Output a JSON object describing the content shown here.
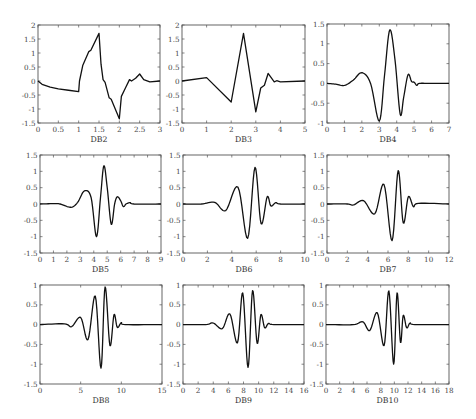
{
  "figure": {
    "panel_labels": [
      "DB2",
      "DB3",
      "DB4",
      "DB5",
      "DB6",
      "DB7",
      "DB8",
      "DB9",
      "DB10"
    ]
  },
  "chart_data": [
    {
      "type": "line",
      "title": "",
      "xlabel": "DB2",
      "ylabel": "",
      "xlim": [
        0,
        3
      ],
      "ylim": [
        -1.5,
        2
      ],
      "xticks": [
        0,
        0.5,
        1,
        1.5,
        2,
        2.5,
        3
      ],
      "xtick_labels": [
        "0",
        "0.5",
        "1",
        "1.5",
        "2",
        "2.5",
        "3"
      ],
      "yticks": [
        -1.5,
        -1,
        -0.5,
        0,
        0.5,
        1,
        1.5,
        2
      ],
      "ytick_labels": [
        "-1.5",
        "-1",
        "-0.5",
        "0",
        "0.5",
        "1",
        "1.5",
        "2"
      ],
      "grid": false,
      "series": [
        {
          "name": "DB2 wavelet",
          "x": [
            0,
            0.1,
            0.3,
            0.5,
            0.75,
            1.0,
            1.02,
            1.1,
            1.25,
            1.3,
            1.5,
            1.55,
            1.6,
            1.65,
            1.75,
            1.8,
            2.0,
            2.05,
            2.15,
            2.25,
            2.3,
            2.4,
            2.5,
            2.6,
            2.75,
            3.0
          ],
          "y": [
            0,
            -0.12,
            -0.22,
            -0.28,
            -0.33,
            -0.38,
            0.0,
            0.55,
            1.05,
            1.1,
            1.7,
            0.6,
            0.05,
            -0.05,
            -0.6,
            -0.65,
            -1.35,
            -0.55,
            -0.25,
            0.05,
            0.0,
            0.1,
            0.25,
            0.05,
            -0.03,
            0.0
          ]
        }
      ]
    },
    {
      "type": "line",
      "title": "",
      "xlabel": "DB3",
      "ylabel": "",
      "xlim": [
        0,
        5
      ],
      "ylim": [
        -1.5,
        2
      ],
      "xticks": [
        0,
        1,
        2,
        3,
        4,
        5
      ],
      "xtick_labels": [
        "0",
        "1",
        "2",
        "3",
        "4",
        "5"
      ],
      "yticks": [
        -1.5,
        -1,
        -0.5,
        0,
        0.5,
        1,
        1.5,
        2
      ],
      "ytick_labels": [
        "-1.5",
        "-1",
        "-0.5",
        "0",
        "0.5",
        "1",
        "1.5",
        "2"
      ],
      "grid": false,
      "series": [
        {
          "name": "DB3 wavelet",
          "x": [
            0,
            1.0,
            2.0,
            2.5,
            3.0,
            3.2,
            3.35,
            3.5,
            3.75,
            3.85,
            4.0,
            5.0
          ],
          "y": [
            0,
            0.12,
            -0.75,
            1.7,
            -1.1,
            -0.25,
            -0.15,
            0.27,
            -0.03,
            0.01,
            -0.03,
            0.0
          ]
        }
      ]
    },
    {
      "type": "line",
      "title": "",
      "xlabel": "DB4",
      "ylabel": "",
      "xlim": [
        0,
        7
      ],
      "ylim": [
        -1,
        1.5
      ],
      "xticks": [
        0,
        1,
        2,
        3,
        4,
        5,
        6,
        7
      ],
      "xtick_labels": [
        "0",
        "1",
        "2",
        "3",
        "4",
        "5",
        "6",
        "7"
      ],
      "yticks": [
        -1,
        -0.5,
        0,
        0.5,
        1,
        1.5
      ],
      "ytick_labels": [
        "-1",
        "-0.5",
        "0",
        "0.5",
        "1",
        "1.5"
      ],
      "grid": false,
      "series": [
        {
          "name": "DB4 wavelet",
          "x": [
            0,
            0.5,
            1.0,
            1.5,
            2.0,
            2.5,
            3.0,
            3.3,
            3.6,
            3.9,
            4.2,
            4.4,
            4.65,
            4.85,
            5.0,
            5.15,
            5.3,
            6.0,
            7.0
          ],
          "y": [
            0,
            -0.02,
            -0.05,
            0.08,
            0.27,
            0.0,
            -0.95,
            0.2,
            1.35,
            0.6,
            -0.78,
            -0.35,
            0.22,
            0.05,
            0.03,
            -0.05,
            0.0,
            0.0,
            0.0
          ]
        }
      ]
    },
    {
      "type": "line",
      "title": "",
      "xlabel": "DB5",
      "ylabel": "",
      "xlim": [
        0,
        9
      ],
      "ylim": [
        -1.5,
        1.5
      ],
      "xticks": [
        0,
        1,
        2,
        3,
        4,
        5,
        6,
        7,
        8,
        9
      ],
      "xtick_labels": [
        "0",
        "1",
        "2",
        "3",
        "4",
        "5",
        "6",
        "7",
        "8",
        "9"
      ],
      "yticks": [
        -1.5,
        -1,
        -0.5,
        0,
        0.5,
        1,
        1.5
      ],
      "ytick_labels": [
        "-1.5",
        "-1",
        "-0.5",
        "0",
        "0.5",
        "1",
        "1.5"
      ],
      "grid": false,
      "series": [
        {
          "name": "DB5 wavelet",
          "x": [
            0,
            1.0,
            1.5,
            2.3,
            2.8,
            3.3,
            3.8,
            4.2,
            4.5,
            4.75,
            5.0,
            5.3,
            5.55,
            5.75,
            6.0,
            6.2,
            6.4,
            6.7,
            7.0,
            9.0
          ],
          "y": [
            0,
            0.01,
            0.0,
            -0.1,
            0.05,
            0.4,
            0.2,
            -1.0,
            0.2,
            1.17,
            0.5,
            -0.62,
            0.0,
            0.22,
            0.1,
            -0.08,
            0.0,
            0.04,
            0.0,
            0.0
          ]
        }
      ]
    },
    {
      "type": "line",
      "title": "",
      "xlabel": "DB6",
      "ylabel": "",
      "xlim": [
        0,
        10
      ],
      "ylim": [
        -1.5,
        1.5
      ],
      "xticks": [
        0,
        2,
        4,
        6,
        8,
        10
      ],
      "xtick_labels": [
        "0",
        "2",
        "4",
        "6",
        "8",
        "10"
      ],
      "yticks": [
        -1.5,
        -1,
        -0.5,
        0,
        0.5,
        1,
        1.5
      ],
      "ytick_labels": [
        "-1.5",
        "-1",
        "-0.5",
        "0",
        "0.5",
        "1",
        "1.5"
      ],
      "grid": false,
      "series": [
        {
          "name": "DB6 wavelet",
          "x": [
            0,
            1.5,
            2.6,
            3.5,
            4.5,
            5.3,
            5.9,
            6.4,
            6.9,
            7.2,
            7.6,
            8.0,
            10.0
          ],
          "y": [
            0,
            0.0,
            0.05,
            -0.2,
            0.52,
            -1.05,
            1.12,
            -0.6,
            0.22,
            -0.06,
            0.04,
            0.0,
            0.0
          ]
        }
      ]
    },
    {
      "type": "line",
      "title": "",
      "xlabel": "DB7",
      "ylabel": "",
      "xlim": [
        0,
        12
      ],
      "ylim": [
        -1.5,
        1.5
      ],
      "xticks": [
        0,
        2,
        4,
        6,
        8,
        10,
        12
      ],
      "xtick_labels": [
        "0",
        "2",
        "4",
        "6",
        "8",
        "10",
        "12"
      ],
      "yticks": [
        -1.5,
        -1,
        -0.5,
        0,
        0.5,
        1,
        1.5
      ],
      "ytick_labels": [
        "-1.5",
        "-1",
        "-0.5",
        "0",
        "0.5",
        "1",
        "1.5"
      ],
      "grid": false,
      "series": [
        {
          "name": "DB7 wavelet",
          "x": [
            0,
            2.0,
            2.6,
            3.6,
            4.7,
            5.6,
            6.4,
            7.0,
            7.5,
            8.0,
            8.5,
            9.0,
            12.0
          ],
          "y": [
            0,
            0.0,
            -0.03,
            0.1,
            -0.3,
            0.6,
            -1.12,
            1.02,
            -0.58,
            0.22,
            -0.08,
            0.02,
            0.0
          ]
        }
      ]
    },
    {
      "type": "line",
      "title": "",
      "xlabel": "DB8",
      "ylabel": "",
      "xlim": [
        0,
        15
      ],
      "ylim": [
        -1.5,
        1
      ],
      "xticks": [
        0,
        5,
        10,
        15
      ],
      "xtick_labels": [
        "0",
        "5",
        "10",
        "15"
      ],
      "yticks": [
        -1.5,
        -1,
        -0.5,
        0,
        0.5,
        1
      ],
      "ytick_labels": [
        "-1.5",
        "-1",
        "-0.5",
        "0",
        "0.5",
        "1"
      ],
      "grid": false,
      "series": [
        {
          "name": "DB8 wavelet",
          "x": [
            0,
            3.0,
            3.9,
            5.0,
            5.9,
            6.8,
            7.5,
            8.0,
            8.6,
            9.1,
            9.5,
            10.0,
            10.5,
            15.0
          ],
          "y": [
            0,
            0.02,
            -0.05,
            0.18,
            -0.38,
            0.72,
            -1.1,
            0.95,
            -0.53,
            0.25,
            -0.07,
            0.05,
            0.0,
            0.0
          ]
        }
      ]
    },
    {
      "type": "line",
      "title": "",
      "xlabel": "DB9",
      "ylabel": "",
      "xlim": [
        0,
        16
      ],
      "ylim": [
        -1.5,
        1
      ],
      "xticks": [
        0,
        2,
        4,
        6,
        8,
        10,
        12,
        14,
        16
      ],
      "xtick_labels": [
        "0",
        "2",
        "4",
        "6",
        "8",
        "10",
        "12",
        "14",
        "16"
      ],
      "yticks": [
        -1.5,
        -1,
        -0.5,
        0,
        0.5,
        1
      ],
      "ytick_labels": [
        "-1.5",
        "-1",
        "-0.5",
        "0",
        "0.5",
        "1"
      ],
      "grid": false,
      "series": [
        {
          "name": "DB9 wavelet",
          "x": [
            0,
            3.0,
            4.0,
            5.2,
            6.2,
            7.2,
            7.9,
            8.6,
            9.2,
            9.8,
            10.3,
            10.8,
            11.3,
            12.0,
            16.0
          ],
          "y": [
            0,
            0.0,
            0.04,
            -0.1,
            0.27,
            -0.46,
            0.8,
            -1.08,
            0.86,
            -0.47,
            0.25,
            -0.08,
            0.03,
            0.0,
            0.0
          ]
        }
      ]
    },
    {
      "type": "line",
      "title": "",
      "xlabel": "DB10",
      "ylabel": "",
      "xlim": [
        0,
        18
      ],
      "ylim": [
        -1.5,
        1
      ],
      "xticks": [
        0,
        2,
        4,
        6,
        8,
        10,
        12,
        14,
        16,
        18
      ],
      "xtick_labels": [
        "0",
        "2",
        "4",
        "6",
        "8",
        "10",
        "12",
        "14",
        "16",
        "18"
      ],
      "yticks": [
        -1.5,
        -1,
        -0.5,
        0,
        0.5,
        1
      ],
      "ytick_labels": [
        "-1.5",
        "-1",
        "-0.5",
        "0",
        "0.5",
        "1"
      ],
      "grid": false,
      "series": [
        {
          "name": "DB10 wavelet",
          "x": [
            0,
            4.0,
            5.4,
            6.4,
            7.5,
            8.5,
            9.2,
            9.9,
            10.4,
            10.9,
            11.3,
            11.8,
            12.3,
            13.0,
            18.0
          ],
          "y": [
            0,
            0.0,
            0.07,
            -0.15,
            0.3,
            -0.53,
            0.85,
            -1.0,
            0.8,
            -0.45,
            0.23,
            -0.08,
            0.04,
            0.0,
            0.0
          ]
        }
      ]
    }
  ],
  "layout": {
    "boxes": [
      {
        "x": 38,
        "y": 25,
        "w": 122,
        "h": 98
      },
      {
        "x": 182,
        "y": 25,
        "w": 123,
        "h": 98
      },
      {
        "x": 327,
        "y": 24,
        "w": 122,
        "h": 99
      },
      {
        "x": 40,
        "y": 155,
        "w": 121,
        "h": 98
      },
      {
        "x": 183,
        "y": 155,
        "w": 122,
        "h": 98
      },
      {
        "x": 327,
        "y": 155,
        "w": 122,
        "h": 98
      },
      {
        "x": 40,
        "y": 285,
        "w": 122,
        "h": 99
      },
      {
        "x": 183,
        "y": 285,
        "w": 121,
        "h": 99
      },
      {
        "x": 326,
        "y": 285,
        "w": 123,
        "h": 99
      }
    ]
  }
}
